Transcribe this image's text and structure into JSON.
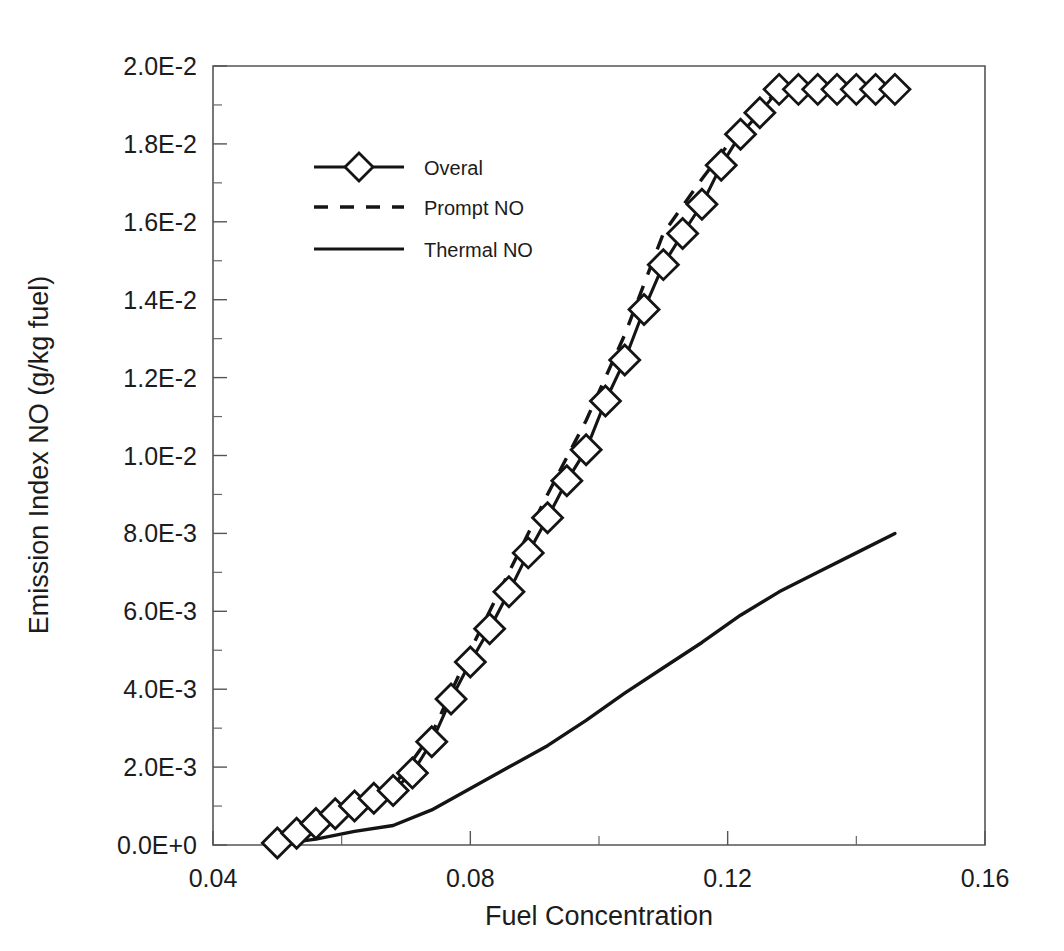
{
  "chart_data": {
    "type": "line",
    "title": "",
    "xlabel": "Fuel Concentration",
    "ylabel": "Emission Index NO (g/kg fuel)",
    "xlim": [
      0.04,
      0.16
    ],
    "ylim": [
      0.0,
      0.02
    ],
    "xticks": [
      0.04,
      0.08,
      0.12,
      0.16
    ],
    "xticklabels": [
      "0.04",
      "0.08",
      "0.12",
      "0.16"
    ],
    "xminortick_step": 0.02,
    "yticks": [
      0.0,
      0.002,
      0.004,
      0.006,
      0.008,
      0.01,
      0.012,
      0.014,
      0.016,
      0.018,
      0.02
    ],
    "yticklabels": [
      "0.0E+0",
      "2.0E-3",
      "4.0E-3",
      "6.0E-3",
      "8.0E-3",
      "1.0E-2",
      "1.2E-2",
      "1.4E-2",
      "1.6E-2",
      "1.8E-2",
      "2.0E-2"
    ],
    "yminortick_step": 0.001,
    "grid": false,
    "legend_position": "upper-left-inside",
    "axis_color": "#555555",
    "line_color": "#141414",
    "background_color": "#ffffff",
    "series": [
      {
        "name": "Overal",
        "style": "solid-with-diamond-markers",
        "marker": "open-diamond",
        "x": [
          0.05,
          0.053,
          0.056,
          0.059,
          0.062,
          0.065,
          0.068,
          0.071,
          0.074,
          0.077,
          0.08,
          0.083,
          0.086,
          0.089,
          0.092,
          0.095,
          0.098,
          0.101,
          0.104,
          0.107,
          0.11,
          0.113,
          0.116,
          0.119,
          0.122,
          0.125,
          0.128,
          0.131,
          0.134,
          0.137,
          0.14,
          0.143,
          0.146
        ],
        "y": [
          5e-05,
          0.0003,
          0.00055,
          0.0008,
          0.001,
          0.0012,
          0.0014,
          0.00185,
          0.00265,
          0.00375,
          0.0047,
          0.00555,
          0.0065,
          0.0075,
          0.0084,
          0.00935,
          0.01015,
          0.0114,
          0.01245,
          0.01375,
          0.0149,
          0.0157,
          0.01645,
          0.01745,
          0.01825,
          0.0188,
          0.0194,
          0.0194,
          0.0194,
          0.0194,
          0.0194,
          0.0194,
          0.0194
        ]
      },
      {
        "name": "Prompt NO",
        "style": "dashed",
        "marker": "none",
        "x": [
          0.05,
          0.056,
          0.062,
          0.068,
          0.074,
          0.08,
          0.086,
          0.092,
          0.098,
          0.104,
          0.11,
          0.116,
          0.122,
          0.128,
          0.134,
          0.14,
          0.146
        ],
        "y": [
          5e-05,
          0.00058,
          0.00105,
          0.0015,
          0.00285,
          0.005,
          0.007,
          0.009,
          0.0109,
          0.0131,
          0.0157,
          0.0171,
          0.0184,
          0.0194,
          0.0194,
          0.0194,
          0.0194
        ]
      },
      {
        "name": "Thermal NO",
        "style": "solid",
        "marker": "none",
        "x": [
          0.05,
          0.056,
          0.062,
          0.068,
          0.074,
          0.08,
          0.086,
          0.092,
          0.098,
          0.104,
          0.11,
          0.116,
          0.122,
          0.128,
          0.134,
          0.14,
          0.146
        ],
        "y": [
          2e-05,
          0.00015,
          0.00035,
          0.0005,
          0.0009,
          0.00145,
          0.002,
          0.00255,
          0.0032,
          0.0039,
          0.00455,
          0.0052,
          0.0059,
          0.0065,
          0.007,
          0.0075,
          0.008
        ]
      }
    ]
  },
  "legend": {
    "entries": [
      {
        "label": "Overal",
        "style": "solid-with-diamond-markers"
      },
      {
        "label": "Prompt NO",
        "style": "dashed"
      },
      {
        "label": "Thermal NO",
        "style": "solid"
      }
    ]
  },
  "axes": {
    "x_title": "Fuel Concentration",
    "y_title": "Emission Index NO (g/kg fuel)"
  }
}
